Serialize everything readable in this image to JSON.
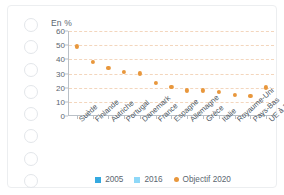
{
  "card": {
    "binding_hole_count": 8,
    "binding_hole_name": "spiral-binding-hole"
  },
  "chart_data": {
    "type": "bar",
    "subtype": "stacked-bar-with-target-markers",
    "title": "",
    "unit_label": "En %",
    "xlabel": "",
    "ylabel": "",
    "ylim": [
      0,
      60
    ],
    "yticks": [
      0,
      10,
      20,
      30,
      40,
      50,
      60
    ],
    "grid": true,
    "grid_style": "dashed-horizontal",
    "legend_position": "bottom-center",
    "categories": [
      "Suède",
      "Finlande",
      "Autriche",
      "Portugal",
      "Danemark",
      "France",
      "Espagne",
      "Allemagne",
      "Grèce",
      "Italie",
      "Royaume-Uni",
      "Pays-Bas",
      "UE à 28"
    ],
    "series": [
      {
        "name": "2005",
        "color": "#34a9e0",
        "values": [
          41,
          29,
          24,
          20,
          16,
          10.5,
          9,
          7.5,
          7.5,
          8,
          1.5,
          2.5,
          9
        ]
      },
      {
        "name": "2016",
        "color": "#8ed8f8",
        "values": [
          55,
          38.5,
          33,
          29,
          31,
          16,
          17.5,
          15,
          15,
          17.5,
          9.5,
          6,
          17.5
        ]
      },
      {
        "name": "Objectif 2020",
        "color": "#e8973c",
        "marker": "dot",
        "values": [
          49,
          38,
          34,
          31,
          30,
          23,
          20.5,
          18,
          18,
          17,
          15,
          14,
          20
        ]
      }
    ],
    "legend": [
      {
        "label": "2005",
        "color": "#34a9e0",
        "marker": "square"
      },
      {
        "label": "2016",
        "color": "#8ed8f8",
        "marker": "square"
      },
      {
        "label": "Objectif 2020",
        "color": "#e8973c",
        "marker": "dot"
      }
    ]
  }
}
